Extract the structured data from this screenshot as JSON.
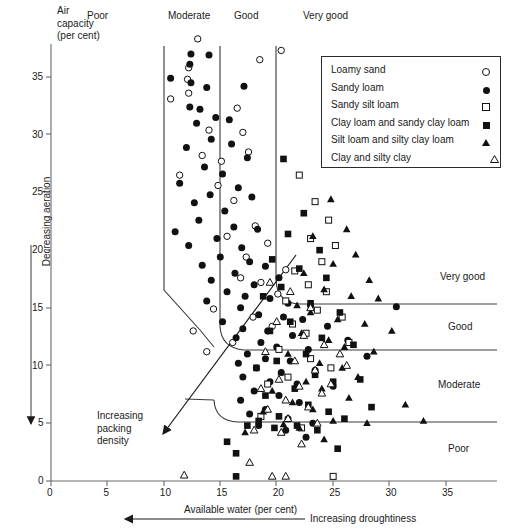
{
  "figure": {
    "y_axis_title_lines": [
      "Air",
      "capacity",
      "(per cent)"
    ],
    "y_axis_arrow_label": "Decreasing aeration",
    "x_axis_title": "Available water (per cent)",
    "x_axis_arrow_label": "Increasing droughtiness",
    "diagonal_arrow_lines": [
      "Increasing",
      "packing",
      "density"
    ]
  },
  "top_categories": [
    {
      "label": "Poor"
    },
    {
      "label": "Moderate"
    },
    {
      "label": "Good"
    },
    {
      "label": "Very good"
    }
  ],
  "right_categories": [
    {
      "label": "Very good"
    },
    {
      "label": "Good"
    },
    {
      "label": "Moderate"
    },
    {
      "label": "Poor"
    }
  ],
  "legend": {
    "items": [
      {
        "label": "Loamy sand",
        "marker": "open-circle"
      },
      {
        "label": "Sandy loam",
        "marker": "filled-circle"
      },
      {
        "label": "Sandy silt loam",
        "marker": "open-square"
      },
      {
        "label": "Clay loam and sandy clay loam",
        "marker": "filled-square"
      },
      {
        "label": "Silt loam and silty clay loam",
        "marker": "filled-triangle"
      },
      {
        "label": "Clay and silty clay",
        "marker": "open-triangle"
      }
    ]
  },
  "chart_data": {
    "type": "scatter",
    "title": "",
    "xlabel": "Available water (per cent)",
    "ylabel": "Air capacity (per cent)",
    "xlim": [
      0,
      36
    ],
    "ylim": [
      0,
      39
    ],
    "xticks": [
      0,
      5,
      10,
      15,
      20,
      25,
      30,
      35
    ],
    "yticks": [
      0,
      5,
      10,
      15,
      20,
      25,
      30,
      35
    ],
    "grid": false,
    "legend_position": "top-right",
    "vertical_class_boundaries": [
      10,
      15,
      20
    ],
    "horizontal_class_boundaries": [
      15,
      10,
      5
    ],
    "top_class_labels": [
      "Poor",
      "Moderate",
      "Good",
      "Very good"
    ],
    "right_class_labels": [
      "Very good",
      "Good",
      "Moderate",
      "Poor"
    ],
    "series": [
      {
        "name": "Loamy sand",
        "marker": "open-circle",
        "points": [
          [
            13.0,
            38.3
          ],
          [
            12.2,
            35.8
          ],
          [
            12.2,
            33.6
          ],
          [
            10.6,
            33.1
          ],
          [
            18.5,
            36.5
          ],
          [
            20.4,
            37.3
          ],
          [
            12.1,
            34.8
          ],
          [
            16.5,
            32.3
          ],
          [
            14.0,
            30.4
          ],
          [
            13.4,
            28.2
          ],
          [
            15.1,
            27.7
          ],
          [
            17.0,
            30.2
          ],
          [
            17.5,
            28.5
          ],
          [
            11.4,
            26.5
          ],
          [
            14.8,
            25.6
          ],
          [
            16.2,
            24.3
          ],
          [
            18.1,
            22.1
          ],
          [
            15.6,
            21.2
          ],
          [
            17.3,
            19.4
          ],
          [
            19.2,
            20.6
          ],
          [
            16.8,
            17.6
          ],
          [
            18.6,
            17.2
          ],
          [
            20.1,
            16.2
          ],
          [
            14.4,
            14.9
          ],
          [
            17.9,
            14.2
          ],
          [
            19.6,
            13.4
          ],
          [
            12.6,
            13.0
          ],
          [
            16.1,
            12.0
          ],
          [
            20.8,
            18.3
          ],
          [
            13.8,
            11.2
          ]
        ]
      },
      {
        "name": "Sandy loam",
        "marker": "filled-circle",
        "points": [
          [
            12.4,
            37.0
          ],
          [
            14.0,
            36.9
          ],
          [
            12.3,
            36.1
          ],
          [
            10.6,
            34.9
          ],
          [
            12.4,
            34.5
          ],
          [
            13.8,
            34.1
          ],
          [
            12.3,
            32.4
          ],
          [
            13.2,
            32.2
          ],
          [
            17.1,
            34.2
          ],
          [
            14.6,
            31.5
          ],
          [
            12.9,
            31.0
          ],
          [
            15.8,
            31.3
          ],
          [
            14.2,
            29.6
          ],
          [
            16.0,
            29.2
          ],
          [
            12.0,
            28.9
          ],
          [
            17.4,
            28.0
          ],
          [
            13.6,
            27.2
          ],
          [
            15.2,
            26.6
          ],
          [
            11.4,
            25.8
          ],
          [
            16.6,
            25.4
          ],
          [
            14.1,
            24.8
          ],
          [
            12.7,
            24.1
          ],
          [
            17.8,
            24.6
          ],
          [
            15.4,
            23.4
          ],
          [
            13.1,
            22.6
          ],
          [
            16.2,
            22.0
          ],
          [
            11.0,
            21.6
          ],
          [
            18.3,
            21.8
          ],
          [
            14.7,
            21.0
          ],
          [
            12.2,
            20.4
          ],
          [
            16.9,
            20.2
          ],
          [
            15.0,
            19.4
          ],
          [
            17.6,
            19.0
          ],
          [
            13.4,
            18.7
          ],
          [
            19.0,
            18.6
          ],
          [
            16.3,
            18.0
          ],
          [
            14.2,
            17.4
          ],
          [
            18.0,
            17.0
          ],
          [
            20.2,
            17.6
          ],
          [
            15.6,
            16.4
          ],
          [
            17.2,
            16.0
          ],
          [
            19.4,
            15.8
          ],
          [
            13.8,
            15.6
          ],
          [
            21.0,
            15.4
          ],
          [
            16.8,
            15.0
          ],
          [
            23.0,
            15.2
          ],
          [
            30.6,
            15.1
          ],
          [
            18.4,
            14.4
          ],
          [
            20.6,
            14.2
          ],
          [
            22.3,
            14.0
          ],
          [
            15.2,
            13.8
          ],
          [
            17.0,
            13.2
          ],
          [
            19.2,
            13.0
          ],
          [
            24.5,
            13.4
          ],
          [
            21.4,
            12.6
          ],
          [
            16.4,
            12.4
          ],
          [
            18.6,
            12.0
          ],
          [
            26.3,
            12.2
          ],
          [
            20.0,
            11.6
          ],
          [
            22.8,
            11.4
          ],
          [
            17.4,
            11.0
          ],
          [
            19.0,
            10.6
          ],
          [
            21.2,
            10.4
          ],
          [
            28.0,
            10.8
          ],
          [
            16.6,
            10.2
          ],
          [
            18.2,
            9.8
          ],
          [
            20.4,
            9.4
          ],
          [
            23.4,
            9.6
          ],
          [
            17.0,
            9.0
          ],
          [
            19.4,
            8.6
          ],
          [
            21.8,
            8.4
          ],
          [
            25.0,
            8.2
          ],
          [
            18.0,
            7.8
          ],
          [
            20.2,
            7.4
          ],
          [
            16.8,
            7.0
          ],
          [
            22.0,
            6.8
          ],
          [
            19.0,
            6.2
          ],
          [
            17.6,
            5.8
          ],
          [
            21.0,
            5.4
          ],
          [
            23.2,
            5.0
          ],
          [
            18.4,
            4.8
          ],
          [
            20.8,
            4.4
          ],
          [
            22.6,
            3.8
          ]
        ]
      },
      {
        "name": "Sandy silt loam",
        "marker": "open-square",
        "points": [
          [
            22.0,
            26.5
          ],
          [
            23.4,
            24.2
          ],
          [
            24.6,
            22.6
          ],
          [
            23.0,
            21.0
          ],
          [
            25.2,
            20.4
          ],
          [
            24.0,
            19.0
          ],
          [
            21.6,
            18.2
          ],
          [
            22.8,
            17.0
          ],
          [
            24.4,
            16.4
          ],
          [
            20.8,
            15.6
          ],
          [
            23.6,
            14.8
          ],
          [
            25.8,
            14.2
          ],
          [
            21.4,
            13.6
          ],
          [
            22.6,
            12.8
          ],
          [
            26.4,
            12.0
          ],
          [
            20.2,
            11.4
          ],
          [
            23.0,
            10.6
          ],
          [
            24.8,
            9.8
          ],
          [
            21.0,
            9.0
          ],
          [
            19.2,
            8.4
          ],
          [
            25.0,
            0.4
          ],
          [
            18.6,
            5.6
          ],
          [
            22.2,
            4.6
          ]
        ]
      },
      {
        "name": "Clay loam and sandy clay loam",
        "marker": "filled-square",
        "points": [
          [
            20.6,
            27.9
          ],
          [
            22.4,
            23.2
          ],
          [
            21.0,
            21.4
          ],
          [
            23.8,
            20.0
          ],
          [
            19.6,
            19.2
          ],
          [
            22.0,
            18.4
          ],
          [
            24.4,
            17.6
          ],
          [
            20.4,
            16.8
          ],
          [
            18.8,
            16.0
          ],
          [
            23.0,
            15.4
          ],
          [
            25.6,
            14.6
          ],
          [
            21.2,
            13.8
          ],
          [
            19.4,
            13.0
          ],
          [
            24.0,
            12.4
          ],
          [
            26.8,
            11.8
          ],
          [
            22.6,
            11.0
          ],
          [
            20.0,
            10.4
          ],
          [
            18.2,
            9.8
          ],
          [
            23.4,
            9.2
          ],
          [
            25.0,
            8.6
          ],
          [
            21.6,
            8.0
          ],
          [
            19.0,
            7.4
          ],
          [
            27.4,
            8.8
          ],
          [
            22.8,
            6.6
          ],
          [
            24.6,
            6.0
          ],
          [
            20.2,
            5.6
          ],
          [
            18.4,
            5.2
          ],
          [
            26.0,
            5.4
          ],
          [
            15.6,
            3.4
          ],
          [
            16.4,
            2.4
          ],
          [
            16.4,
            0.4
          ],
          [
            21.8,
            4.8
          ],
          [
            23.6,
            4.4
          ],
          [
            28.4,
            6.4
          ],
          [
            25.4,
            2.8
          ],
          [
            17.4,
            4.8
          ],
          [
            19.8,
            4.6
          ]
        ]
      },
      {
        "name": "Silt loam and silty clay loam",
        "marker": "filled-triangle",
        "points": [
          [
            24.8,
            24.4
          ],
          [
            26.2,
            21.8
          ],
          [
            23.2,
            21.2
          ],
          [
            27.0,
            19.6
          ],
          [
            25.0,
            18.8
          ],
          [
            22.4,
            18.0
          ],
          [
            28.2,
            17.4
          ],
          [
            24.2,
            16.6
          ],
          [
            26.6,
            16.0
          ],
          [
            21.8,
            15.2
          ],
          [
            29.0,
            15.8
          ],
          [
            23.0,
            14.6
          ],
          [
            25.4,
            14.0
          ],
          [
            27.8,
            13.6
          ],
          [
            30.2,
            13.0
          ],
          [
            22.2,
            12.8
          ],
          [
            24.6,
            12.2
          ],
          [
            26.0,
            11.6
          ],
          [
            28.6,
            11.2
          ],
          [
            21.0,
            11.0
          ],
          [
            23.8,
            10.2
          ],
          [
            25.8,
            9.8
          ],
          [
            20.4,
            9.4
          ],
          [
            27.2,
            9.0
          ],
          [
            22.6,
            8.6
          ],
          [
            24.0,
            8.0
          ],
          [
            19.6,
            7.8
          ],
          [
            26.4,
            7.2
          ],
          [
            21.4,
            6.8
          ],
          [
            23.2,
            6.2
          ],
          [
            31.4,
            6.6
          ],
          [
            18.8,
            6.0
          ],
          [
            25.0,
            5.2
          ],
          [
            20.6,
            4.9
          ],
          [
            28.0,
            5.0
          ],
          [
            22.0,
            4.6
          ],
          [
            33.0,
            5.2
          ],
          [
            17.2,
            4.2
          ],
          [
            24.2,
            3.6
          ]
        ]
      },
      {
        "name": "Clay and silty clay",
        "marker": "open-triangle",
        "points": [
          [
            19.4,
            17.2
          ],
          [
            21.2,
            16.4
          ],
          [
            23.0,
            15.0
          ],
          [
            20.0,
            13.8
          ],
          [
            22.4,
            12.6
          ],
          [
            24.2,
            11.8
          ],
          [
            19.0,
            11.2
          ],
          [
            21.6,
            10.4
          ],
          [
            23.4,
            9.6
          ],
          [
            25.6,
            11.0
          ],
          [
            20.2,
            8.8
          ],
          [
            22.0,
            8.2
          ],
          [
            18.6,
            8.0
          ],
          [
            24.0,
            7.6
          ],
          [
            20.8,
            7.0
          ],
          [
            22.8,
            6.4
          ],
          [
            19.2,
            6.2
          ],
          [
            26.2,
            10.0
          ],
          [
            21.0,
            5.4
          ],
          [
            23.6,
            5.0
          ],
          [
            18.0,
            4.4
          ],
          [
            20.4,
            4.2
          ],
          [
            22.2,
            3.2
          ],
          [
            11.8,
            0.5
          ],
          [
            19.6,
            0.4
          ],
          [
            20.8,
            0.4
          ],
          [
            17.6,
            1.6
          ],
          [
            24.8,
            8.4
          ]
        ]
      }
    ]
  }
}
